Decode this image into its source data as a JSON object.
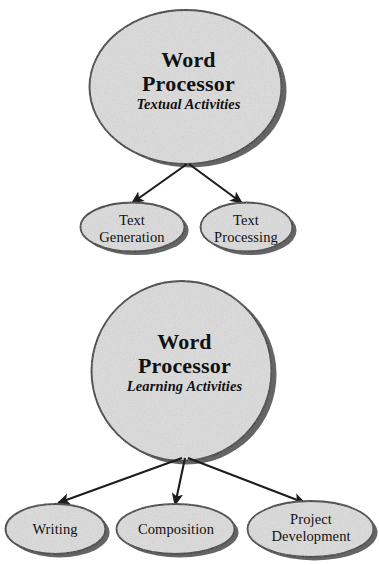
{
  "diagram": {
    "background_color": "#ffffff",
    "node_fill_color": "#dcdcdc",
    "node_stroke_color": "#2b2b2b",
    "node_shadow_color": "#4a4a4a",
    "arrow_color": "#1c1c1c"
  },
  "maps": [
    {
      "id": "textual",
      "hub": {
        "shape": "ellipse",
        "title_line1": "Word",
        "title_line2": "Processor",
        "subtitle": "Textual Activities"
      },
      "leaves": [
        {
          "id": "text-generation",
          "line1": "Text",
          "line2": "Generation"
        },
        {
          "id": "text-processing",
          "line1": "Text",
          "line2": "Processing"
        }
      ]
    },
    {
      "id": "learning",
      "hub": {
        "shape": "circle",
        "title_line1": "Word",
        "title_line2": "Processor",
        "subtitle": "Learning Activities"
      },
      "leaves": [
        {
          "id": "writing",
          "line1": "Writing",
          "line2": ""
        },
        {
          "id": "composition",
          "line1": "Composition",
          "line2": ""
        },
        {
          "id": "project-development",
          "line1": "Project",
          "line2": "Development"
        }
      ]
    }
  ],
  "connectors": [
    {
      "id": "textual-to-text-generation",
      "from": "textual-hub",
      "to": "text-generation",
      "style": "arrow"
    },
    {
      "id": "textual-to-text-processing",
      "from": "textual-hub",
      "to": "text-processing",
      "style": "arrow"
    },
    {
      "id": "learning-to-writing",
      "from": "learning-hub",
      "to": "writing",
      "style": "arrow"
    },
    {
      "id": "learning-to-composition",
      "from": "learning-hub",
      "to": "composition",
      "style": "arrow"
    },
    {
      "id": "learning-to-project-development",
      "from": "learning-hub",
      "to": "project-development",
      "style": "arrow"
    }
  ]
}
